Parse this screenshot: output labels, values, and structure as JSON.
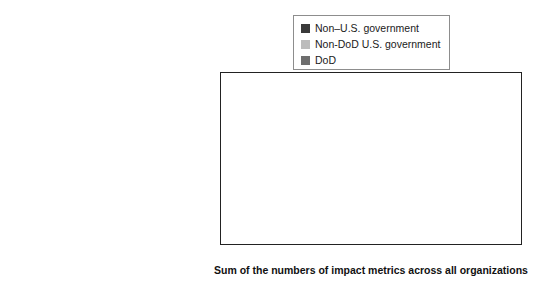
{
  "chart_data": {
    "type": "bar",
    "orientation": "horizontal",
    "stacked": true,
    "title": "",
    "xlabel": "Sum of the numbers of impact metrics across all organizations",
    "ylabel": "",
    "xlim": [
      0,
      25
    ],
    "xticks": [
      0,
      5,
      10,
      15,
      20,
      25
    ],
    "xtick_labels": [
      "0",
      "5",
      "10",
      "15",
      "20",
      "25"
    ],
    "grid": false,
    "legend_position": "top-right",
    "categories": [
      "Improved health outcomes",
      "Attitudinal changes",
      "Cost-effectiveness and economic returns",
      "Impact narratives"
    ],
    "series": [
      {
        "name": "Non–U.S. government",
        "color": "#3a3a3a",
        "values": [
          6,
          3.8,
          8,
          7
        ]
      },
      {
        "name": "Non-DoD U.S. government",
        "color": "#bcbcbc",
        "values": [
          12,
          1.2,
          8,
          12.5
        ]
      },
      {
        "name": "DoD",
        "color": "#6e6e6e",
        "values": [
          0,
          0,
          1,
          3.5
        ]
      }
    ],
    "totals": [
      18,
      5,
      17,
      23
    ]
  },
  "legend": {
    "items": [
      {
        "label": "Non–U.S. government",
        "color": "#3a3a3a"
      },
      {
        "label": "Non-DoD U.S. government",
        "color": "#bcbcbc"
      },
      {
        "label": "DoD",
        "color": "#6e6e6e"
      }
    ]
  }
}
